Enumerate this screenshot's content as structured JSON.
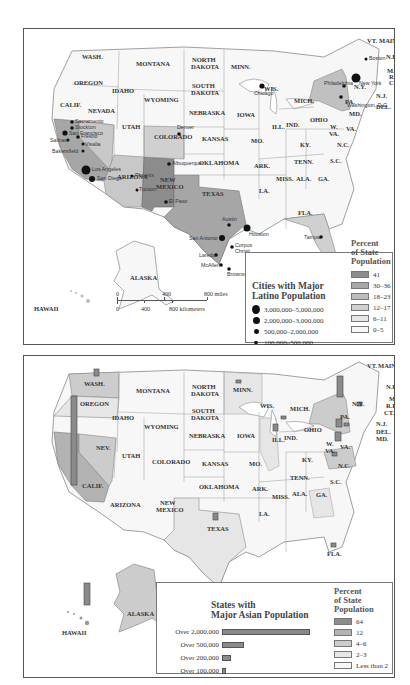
{
  "map1": {
    "title": "Cities with Major Latino Population",
    "title_line1": "Cities with Major",
    "title_line2": "Latino Population",
    "city_size_legend": [
      {
        "label": "3,000,000–5,000,000",
        "size": 9
      },
      {
        "label": "2,000,000–3,000,000",
        "size": 7
      },
      {
        "label": "500,000–2,000,000",
        "size": 5
      },
      {
        "label": "100,000–500,000",
        "size": 3.5
      }
    ],
    "percent_title_line1": "Percent",
    "percent_title_line2": "of State",
    "percent_title_line3": "Population",
    "percent_legend": [
      {
        "label": "41",
        "color": "#8c8c8c"
      },
      {
        "label": "30–36",
        "color": "#a6a6a6"
      },
      {
        "label": "18–23",
        "color": "#bdbdbd"
      },
      {
        "label": "12–17",
        "color": "#d0d0d0"
      },
      {
        "label": "6–11",
        "color": "#e6e6e6"
      },
      {
        "label": "0–5",
        "color": "#f7f7f7"
      }
    ],
    "scale": {
      "miles": [
        "0",
        "400",
        "800 miles"
      ],
      "km": [
        "0",
        "400",
        "800 kilometers"
      ]
    },
    "states": [
      "WASH.",
      "OREGON",
      "CALIF.",
      "NEVADA",
      "IDAHO",
      "MONTANA",
      "WYOMING",
      "UTAH",
      "ARIZONA",
      "COLORADO",
      "NEW MEXICO",
      "NORTH DAKOTA",
      "SOUTH DAKOTA",
      "NEBRASKA",
      "KANSAS",
      "OKLAHOMA",
      "TEXAS",
      "MINN.",
      "IOWA",
      "MO.",
      "ARK.",
      "LA.",
      "WIS.",
      "ILL.",
      "MICH.",
      "IND.",
      "OHIO",
      "KY.",
      "TENN.",
      "MISS.",
      "ALA.",
      "GA.",
      "FLA.",
      "S.C.",
      "N.C.",
      "VA.",
      "W. VA.",
      "PA.",
      "N.Y.",
      "VT.",
      "MAINE",
      "N.H.",
      "MASS.",
      "R.I.",
      "CONN.",
      "N.J.",
      "DEL.",
      "MD.",
      "ALASKA",
      "HAWAII"
    ],
    "cities": [
      "Sacramento",
      "Stockton",
      "San Francisco",
      "Salinas",
      "Fresno",
      "Visalia",
      "Bakersfield",
      "Los Angeles",
      "San Diego",
      "Phoenix",
      "Tucson",
      "Albuquerque",
      "El Paso",
      "Denver",
      "San Antonio",
      "Austin",
      "Houston",
      "Corpus Christi",
      "Laredo",
      "McAllen",
      "Brownsville",
      "Tampa",
      "Miami",
      "Chicago",
      "Philadelphia",
      "New York",
      "Boston",
      "Washington, D.C."
    ]
  },
  "map2": {
    "title_line1": "States with",
    "title_line2": "Major Asian Population",
    "bars": [
      {
        "label": "Over 2,000,000",
        "width": 132
      },
      {
        "label": "Over 500,000",
        "width": 33
      },
      {
        "label": "Over 200,000",
        "width": 13
      },
      {
        "label": "Over 100,000",
        "width": 6
      }
    ],
    "percent_title_line1": "Percent",
    "percent_title_line2": "of State",
    "percent_title_line3": "Population",
    "percent_legend": [
      {
        "label": "64",
        "color": "#8c8c8c"
      },
      {
        "label": "12",
        "color": "#b3b3b3"
      },
      {
        "label": "4–6",
        "color": "#cccccc"
      },
      {
        "label": "2–3",
        "color": "#e6e6e6"
      },
      {
        "label": "Less than 2",
        "color": "#f7f7f7"
      }
    ],
    "states": [
      "WASH.",
      "OREGON",
      "CALIF.",
      "NEV.",
      "IDAHO",
      "MONTANA",
      "WYOMING",
      "UTAH",
      "ARIZONA",
      "COLORADO",
      "NEW MEXICO",
      "NORTH DAKOTA",
      "SOUTH DAKOTA",
      "NEBRASKA",
      "KANSAS",
      "OKLAHOMA",
      "TEXAS",
      "MINN.",
      "IOWA",
      "MO.",
      "ARK.",
      "LA.",
      "WIS.",
      "ILL.",
      "MICH.",
      "IND.",
      "OHIO",
      "KY.",
      "TENN.",
      "MISS.",
      "ALA.",
      "GA.",
      "FLA.",
      "S.C.",
      "N.C.",
      "VA.",
      "W. VA.",
      "PA.",
      "N.Y.",
      "VT.",
      "MAINE",
      "N.H.",
      "MASS.",
      "R.I.",
      "CT.",
      "N.J.",
      "DEL.",
      "MD.",
      "ALASKA",
      "HAWAII"
    ]
  }
}
